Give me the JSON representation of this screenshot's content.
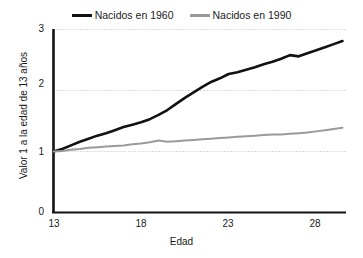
{
  "legend": {
    "position": "top-center",
    "entries": [
      {
        "label": "Nacidos en 1960",
        "color": "#121212"
      },
      {
        "label": "Nacidos en 1990",
        "color": "#9a9a9a"
      }
    ]
  },
  "axes": {
    "xlabel": "Edad",
    "ylabel": "Valor 1 a la edad de 13 años",
    "xticks": [
      "13",
      "18",
      "23",
      "28"
    ],
    "yticks": [
      "0",
      "1",
      "2",
      "3"
    ]
  },
  "chart_data": {
    "type": "line",
    "title": "",
    "xlabel": "Edad",
    "ylabel": "Valor 1 a la edad de 13 años",
    "xlim": [
      13,
      29.7
    ],
    "ylim": [
      0,
      3
    ],
    "xticks": [
      13,
      18,
      23,
      28
    ],
    "yticks": [
      0,
      1,
      2,
      3
    ],
    "grid": "horizontal-dotted",
    "legend_position": "top-center",
    "x": [
      13,
      13.5,
      14,
      14.5,
      15,
      15.5,
      16,
      16.5,
      17,
      17.5,
      18,
      18.5,
      19,
      19.5,
      20,
      20.5,
      21,
      21.5,
      22,
      22.5,
      23,
      23.5,
      24,
      24.5,
      25,
      25.5,
      26,
      26.5,
      27,
      27.5,
      28,
      28.5,
      29,
      29.5
    ],
    "series": [
      {
        "name": "Nacidos en 1960",
        "color": "#121212",
        "values": [
          1.0,
          1.04,
          1.1,
          1.16,
          1.21,
          1.26,
          1.3,
          1.35,
          1.4,
          1.44,
          1.48,
          1.53,
          1.6,
          1.68,
          1.78,
          1.88,
          1.97,
          2.06,
          2.14,
          2.2,
          2.27,
          2.3,
          2.34,
          2.38,
          2.43,
          2.47,
          2.52,
          2.58,
          2.56,
          2.61,
          2.66,
          2.71,
          2.76,
          2.81
        ]
      },
      {
        "name": "Nacidos en 1990",
        "color": "#9a9a9a",
        "values": [
          1.0,
          1.01,
          1.03,
          1.04,
          1.06,
          1.07,
          1.08,
          1.09,
          1.1,
          1.12,
          1.13,
          1.15,
          1.18,
          1.16,
          1.17,
          1.18,
          1.19,
          1.2,
          1.21,
          1.22,
          1.23,
          1.24,
          1.25,
          1.26,
          1.27,
          1.28,
          1.28,
          1.29,
          1.3,
          1.31,
          1.33,
          1.35,
          1.37,
          1.39
        ]
      }
    ]
  }
}
